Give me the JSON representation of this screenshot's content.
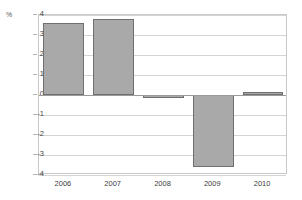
{
  "chart_data": {
    "type": "bar",
    "title": "",
    "xlabel": "",
    "ylabel": "%",
    "categories": [
      "2006",
      "2007",
      "2008",
      "2009",
      "2010"
    ],
    "values": [
      3.6,
      3.8,
      -0.1,
      -3.6,
      0.15
    ],
    "ylim": [
      -4,
      4
    ],
    "yticks": [
      "4",
      "3",
      "2",
      "1",
      "0",
      "-1",
      "-2",
      "-3",
      "-4"
    ],
    "ytick_values": [
      4,
      3,
      2,
      1,
      0,
      -1,
      -2,
      -3,
      -4
    ],
    "grid": true,
    "legend": false,
    "series": [
      {
        "name": "",
        "values": [
          3.6,
          3.8,
          -0.1,
          -3.6,
          0.15
        ]
      }
    ],
    "colors": {
      "bar_fill": "#a9a9a9",
      "bar_border": "#6f6f6f",
      "gridline": "#d5d5d5",
      "zero_line": "#9a9a9a",
      "frame": "#c9c9c9",
      "text": "#3d3d3d"
    }
  },
  "unit_label": "%",
  "title_text": ""
}
